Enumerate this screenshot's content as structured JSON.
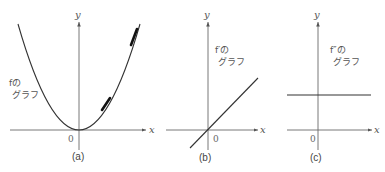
{
  "panels": [
    {
      "caption": "(a)",
      "axis_x": "x",
      "axis_y": "y",
      "origin": "0",
      "label_line1": "fの",
      "label_line2": "グラフ",
      "curve": "parabola"
    },
    {
      "caption": "(b)",
      "axis_x": "x",
      "axis_y": "y",
      "origin": "0",
      "label_line1": "f′の",
      "label_line2": "グラフ",
      "curve": "increasing line through origin"
    },
    {
      "caption": "(c)",
      "axis_x": "x",
      "axis_y": "y",
      "origin": "0",
      "label_line1": "f″の",
      "label_line2": "グラフ",
      "curve": "horizontal positive constant"
    }
  ],
  "colors": {
    "axis": "#6a6a6a",
    "curve": "#333333",
    "text": "#555555"
  }
}
